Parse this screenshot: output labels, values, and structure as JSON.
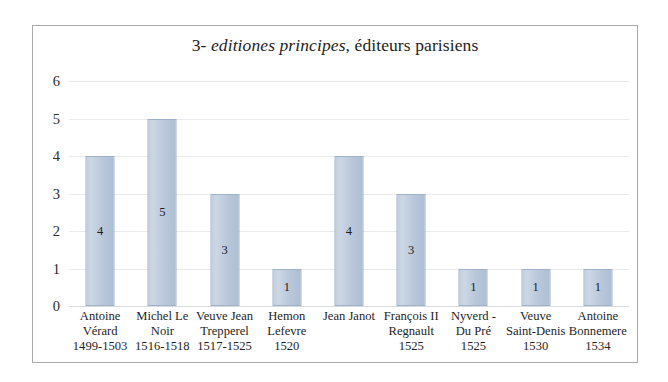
{
  "chart_data": {
    "type": "bar",
    "title": "3- editiones principes, éditeurs parisiens",
    "title_parts": {
      "prefix": "3- ",
      "italic": "editiones principes",
      "suffix": ", éditeurs parisiens"
    },
    "xlabel": "",
    "ylabel": "",
    "ylim": [
      0,
      6
    ],
    "ytick_labels": [
      "0",
      "1",
      "2",
      "3",
      "4",
      "5",
      "6"
    ],
    "ytick_values": [
      0,
      1,
      2,
      3,
      4,
      5,
      6
    ],
    "grid": true,
    "legend": "none",
    "bar_color": "#c3cfdf",
    "bar_border_color": "#9fb2c9",
    "gridline_color": "#e8eaec",
    "frame_color": "#a9a9a9",
    "categories": [
      "Antoine Vérard 1499-1503",
      "Michel Le Noir 1516-1518",
      "Veuve Jean Trepperel 1517-1525",
      "Hemon Lefevre 1520",
      "Jean Janot",
      "François II Regnault 1525",
      "Nyverd - Du Pré 1525",
      "Veuve Saint-Denis 1530",
      "Antoine Bonnemere 1534"
    ],
    "category_lines": [
      [
        "Antoine",
        "Vérard",
        "1499-1503"
      ],
      [
        "Michel Le",
        "Noir",
        "1516-1518"
      ],
      [
        "Veuve Jean",
        "Trepperel",
        "1517-1525"
      ],
      [
        "Hemon",
        "Lefevre",
        "1520"
      ],
      [
        "Jean Janot"
      ],
      [
        "François II",
        "Regnault",
        "1525"
      ],
      [
        "Nyverd -",
        "Du Pré",
        "1525"
      ],
      [
        "Veuve",
        "Saint-Denis",
        "1530"
      ],
      [
        "Antoine",
        "Bonnemere",
        "1534"
      ]
    ],
    "values": [
      4,
      5,
      3,
      1,
      4,
      3,
      1,
      1,
      1
    ],
    "data_labels": [
      "4",
      "5",
      "3",
      "1",
      "4",
      "3",
      "1",
      "1",
      "1"
    ]
  }
}
